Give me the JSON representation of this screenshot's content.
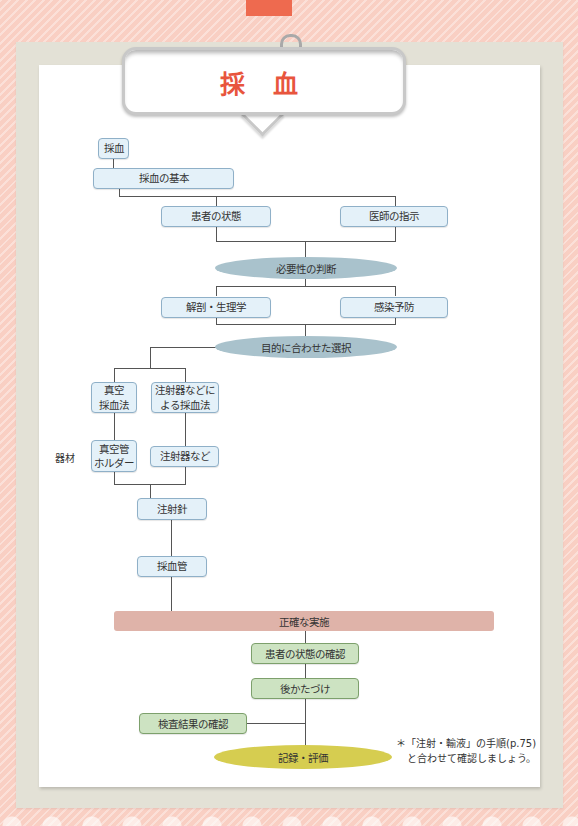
{
  "title": "採 血",
  "flow": {
    "root": "採血",
    "basics": "採血の基本",
    "patient_state": "患者の状態",
    "doctor_order": "医師の指示",
    "necessity": "必要性の判断",
    "anatomy": "解剖・生理学",
    "infection": "感染予防",
    "purpose_selection": "目的に合わせた選択",
    "vacuum_method_1": "真空",
    "vacuum_method_2": "採血法",
    "syringe_method_1": "注射器などに",
    "syringe_method_2": "よる採血法",
    "equipment_label": "器材",
    "vacuum_holder_1": "真空管",
    "vacuum_holder_2": "ホルダー",
    "syringe_etc": "注射器など",
    "needle": "注射針",
    "blood_tube": "採血管",
    "accurate_execution": "正確な実施",
    "check_patient": "患者の状態の確認",
    "cleanup": "後かたづけ",
    "check_results": "検査結果の確認",
    "record_evaluate": "記録・評価"
  },
  "note": {
    "line1": "＊「注射・輸液」の手順(p.75)",
    "line2": "と合わせて確認しましょう。"
  },
  "colors": {
    "title": "#e8553d",
    "blue_box": "#e4f1f9",
    "green_box": "#cde3c2",
    "ellipse_blue": "#a9c2cc",
    "ellipse_yellow": "#d6cd50",
    "bar_pink": "#dfb3a9"
  }
}
